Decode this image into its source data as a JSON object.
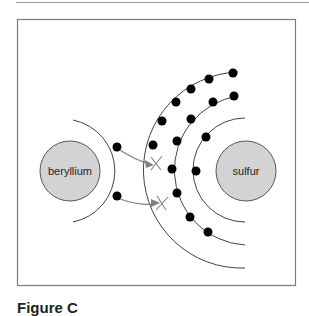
{
  "figure": {
    "caption": "Figure C",
    "atoms": [
      {
        "label": "beryllium",
        "cx": 70,
        "cy": 171,
        "r": 30
      },
      {
        "label": "sulfur",
        "cx": 246,
        "cy": 171,
        "r": 30
      }
    ],
    "colors": {
      "nucleus_fill": "#d3d3d3",
      "stroke": "#444444",
      "electron": "#000000",
      "arrow": "#808080",
      "frame": "#7a7a7a"
    }
  }
}
